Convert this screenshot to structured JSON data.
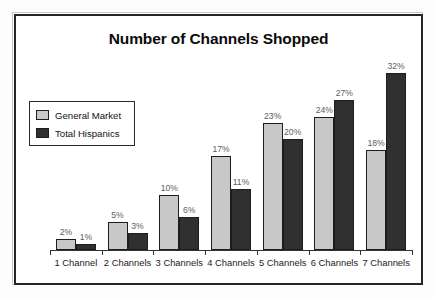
{
  "chart_data": {
    "type": "bar",
    "title": "Number of Channels Shopped",
    "xlabel": "",
    "ylabel": "",
    "ylim": [
      0,
      35
    ],
    "grid": false,
    "legend_position": "upper-left-inside",
    "categories": [
      "1 Channel",
      "2 Channels",
      "3 Channels",
      "4 Channels",
      "5 Channels",
      "6 Channels",
      "7 Channels"
    ],
    "series": [
      {
        "name": "General Market",
        "color": "#c8c8c8",
        "values": [
          2,
          5,
          10,
          17,
          23,
          24,
          18
        ],
        "data_labels": [
          "2%",
          "5%",
          "10%",
          "17%",
          "23%",
          "24%",
          "18%"
        ]
      },
      {
        "name": "Total Hispanics",
        "color": "#303030",
        "values": [
          1,
          3,
          6,
          11,
          20,
          27,
          32
        ],
        "data_labels": [
          "1%",
          "3%",
          "6%",
          "11%",
          "20%",
          "27%",
          "32%"
        ]
      }
    ]
  },
  "legend": {
    "items": [
      {
        "label": "General Market",
        "color": "#c8c8c8"
      },
      {
        "label": "Total Hispanics",
        "color": "#303030"
      }
    ]
  },
  "style": {
    "light_bar": "#c8c8c8",
    "dark_bar": "#303030",
    "bar_outline": "#1d1d1d",
    "frame": "#262626",
    "label_text": "#5d5d5d",
    "axis": "#333333"
  }
}
